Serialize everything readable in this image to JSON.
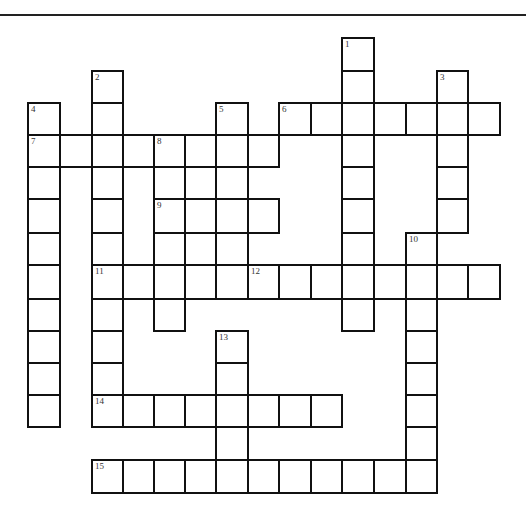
{
  "puzzle": {
    "type": "crossword",
    "grid_geometry": {
      "col_edges": [
        27,
        59,
        91,
        122,
        153,
        184,
        215,
        247,
        278,
        310,
        341,
        373,
        405,
        436,
        467,
        499
      ],
      "row_edges": [
        37,
        70,
        102,
        134,
        166,
        198,
        232,
        264,
        298,
        330,
        362,
        394,
        426,
        459,
        492
      ]
    },
    "words": [
      {
        "number": "1",
        "direction": "down",
        "col": 10,
        "row": 0,
        "length": 9
      },
      {
        "number": "2",
        "direction": "down",
        "col": 2,
        "row": 1,
        "length": 11
      },
      {
        "number": "3",
        "direction": "down",
        "col": 13,
        "row": 1,
        "length": 5
      },
      {
        "number": "4",
        "direction": "down",
        "col": 0,
        "row": 2,
        "length": 10
      },
      {
        "number": "5",
        "direction": "down",
        "col": 6,
        "row": 2,
        "length": 6
      },
      {
        "number": "6",
        "direction": "across",
        "col": 8,
        "row": 2,
        "length": 7
      },
      {
        "number": "7",
        "direction": "across",
        "col": 0,
        "row": 3,
        "length": 8
      },
      {
        "number": "8",
        "direction": "down",
        "col": 4,
        "row": 3,
        "length": 6
      },
      {
        "number": "9",
        "direction": "across",
        "col": 4,
        "row": 5,
        "length": 4
      },
      {
        "number": "10",
        "direction": "down",
        "col": 12,
        "row": 6,
        "length": 8
      },
      {
        "number": "11",
        "direction": "across",
        "col": 2,
        "row": 7,
        "length": 4
      },
      {
        "number": "12",
        "direction": "across",
        "col": 7,
        "row": 7,
        "length": 8
      },
      {
        "number": "13",
        "direction": "down",
        "col": 6,
        "row": 9,
        "length": 5
      },
      {
        "number": "14",
        "direction": "across",
        "col": 2,
        "row": 11,
        "length": 8
      },
      {
        "number": "15",
        "direction": "across",
        "col": 2,
        "row": 13,
        "length": 11
      }
    ],
    "extra_cells": [
      {
        "col": 5,
        "row": 4
      },
      {
        "col": 5,
        "row": 6
      }
    ]
  }
}
